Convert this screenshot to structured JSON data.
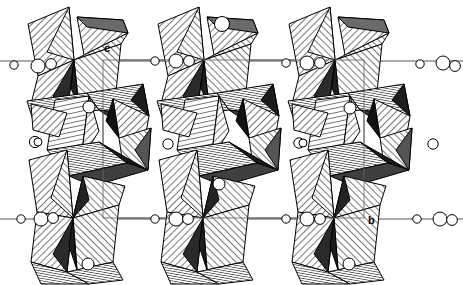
{
  "figure": {
    "kind": "crystal-structure-polyhedral-diagram",
    "title": "",
    "background_color": "#ffffff",
    "line_color": "#000000",
    "cell_line_color": "#555555",
    "width": 463,
    "height": 285
  },
  "axes": {
    "labels": [
      {
        "name": "c",
        "text": "c",
        "x": 104,
        "y": 52
      },
      {
        "name": "b",
        "text": "b",
        "x": 368,
        "y": 224
      }
    ]
  },
  "unit_cell": {
    "label": "unit-cell-box",
    "x": 103,
    "y": 60,
    "width": 261,
    "height": 158,
    "stroke": "#555555",
    "stroke_width": 1
  },
  "chart_data": {
    "type": "scatter",
    "xlabel": "b",
    "ylabel": "c",
    "grid": false,
    "legend": null,
    "columns": 3,
    "column_centers_x": [
      80,
      210,
      341
    ],
    "atom_rows_y": [
      60,
      218
    ],
    "atom_clusters": [
      {
        "name": "cluster-left-top",
        "cx": 14,
        "cy": 65,
        "r": 4.2
      },
      {
        "name": "cluster-left-top",
        "cx": 38,
        "cy": 66,
        "r": 7.0
      },
      {
        "name": "cluster-left-top",
        "cx": 51,
        "cy": 64,
        "r": 5.4
      },
      {
        "name": "cluster-mid1-top",
        "cx": 155,
        "cy": 61,
        "r": 4.2
      },
      {
        "name": "cluster-mid1-top",
        "cx": 176,
        "cy": 61,
        "r": 7.0
      },
      {
        "name": "cluster-mid1-top",
        "cx": 189,
        "cy": 61,
        "r": 5.4
      },
      {
        "name": "cluster-mid2-top",
        "cx": 286,
        "cy": 63,
        "r": 4.2
      },
      {
        "name": "cluster-mid2-top",
        "cx": 307,
        "cy": 63,
        "r": 7.0
      },
      {
        "name": "cluster-mid2-top",
        "cx": 320,
        "cy": 63,
        "r": 5.4
      },
      {
        "name": "cluster-right-top",
        "cx": 420,
        "cy": 64,
        "r": 4.2
      },
      {
        "name": "cluster-right-top",
        "cx": 443,
        "cy": 63,
        "r": 7.0
      },
      {
        "name": "cluster-right-top",
        "cx": 455,
        "cy": 66,
        "r": 5.4
      },
      {
        "name": "cluster-left-bottom",
        "cx": 21,
        "cy": 219,
        "r": 4.2
      },
      {
        "name": "cluster-left-bottom",
        "cx": 41,
        "cy": 219,
        "r": 7.0
      },
      {
        "name": "cluster-left-bottom",
        "cx": 53,
        "cy": 218,
        "r": 5.4
      },
      {
        "name": "cluster-mid1-bottom",
        "cx": 155,
        "cy": 219,
        "r": 4.2
      },
      {
        "name": "cluster-mid1-bottom",
        "cx": 176,
        "cy": 219,
        "r": 7.0
      },
      {
        "name": "cluster-mid1-bottom",
        "cx": 188,
        "cy": 219,
        "r": 5.4
      },
      {
        "name": "cluster-mid2-bottom",
        "cx": 286,
        "cy": 219,
        "r": 4.2
      },
      {
        "name": "cluster-mid2-bottom",
        "cx": 307,
        "cy": 219,
        "r": 7.0
      },
      {
        "name": "cluster-mid2-bottom",
        "cx": 320,
        "cy": 219,
        "r": 5.4
      },
      {
        "name": "cluster-right-bottom",
        "cx": 417,
        "cy": 219,
        "r": 4.2
      },
      {
        "name": "cluster-right-bottom",
        "cx": 440,
        "cy": 219,
        "r": 7.0
      },
      {
        "name": "cluster-right-bottom",
        "cx": 452,
        "cy": 220,
        "r": 5.4
      },
      {
        "name": "atom-mid-left",
        "cx": 35,
        "cy": 142,
        "r": 5.6
      },
      {
        "name": "atom-mid-left2",
        "cx": 38,
        "cy": 142,
        "r": 4.0
      },
      {
        "name": "atom-mid-c1",
        "cx": 168,
        "cy": 144,
        "r": 5.2
      },
      {
        "name": "atom-mid-c2",
        "cx": 299,
        "cy": 143,
        "r": 5.2
      },
      {
        "name": "atom-mid-c3",
        "cx": 303,
        "cy": 143,
        "r": 4.0
      },
      {
        "name": "atom-mid-right",
        "cx": 433,
        "cy": 144,
        "r": 5.2
      },
      {
        "name": "atom-inner-col1",
        "cx": 89,
        "cy": 107,
        "r": 6.0
      },
      {
        "name": "atom-inner-col2",
        "cx": 222,
        "cy": 24,
        "r": 7.5
      },
      {
        "name": "atom-inner-col3",
        "cx": 350,
        "cy": 108,
        "r": 6.0
      },
      {
        "name": "atom-lower-col1",
        "cx": 88,
        "cy": 264,
        "r": 6.0
      },
      {
        "name": "atom-lower-col2",
        "cx": 219,
        "cy": 184,
        "r": 6.0
      },
      {
        "name": "atom-lower-col3",
        "cx": 349,
        "cy": 264,
        "r": 6.0
      }
    ]
  },
  "polyhedra": {
    "description": "Hatched tetrahedra forming corner-sharing chains in three vertical columns",
    "fill_styles": [
      "hatch-light",
      "hatch-dense",
      "solid-dark",
      "gray-fill"
    ],
    "column_offsets_x": [
      0,
      130.5,
      261
    ]
  }
}
